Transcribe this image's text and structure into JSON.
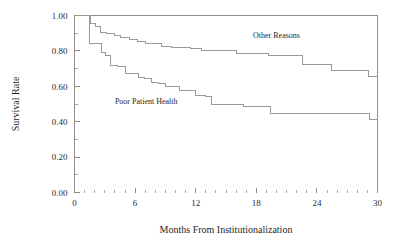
{
  "chart_data": {
    "type": "line",
    "subtype": "kaplan-meier-step",
    "title": "",
    "xlabel": "Months From Institutionalization",
    "ylabel": "Survival Rate",
    "xlim": [
      0,
      30
    ],
    "ylim": [
      0.0,
      1.0
    ],
    "grid": false,
    "legend_position": "inline-annotation",
    "xticks": [
      0,
      6,
      12,
      18,
      24,
      30
    ],
    "xtick_labels": [
      "0",
      "6",
      "12",
      "18",
      "24",
      "30"
    ],
    "x_minor_tick_interval": 1,
    "yticks": [
      0.0,
      0.2,
      0.4,
      0.6,
      0.8,
      1.0
    ],
    "ytick_labels": [
      "0.00",
      "0.20",
      "0.40",
      "0.60",
      "0.80",
      "1.00"
    ],
    "y_minor_tick_interval": 0.1,
    "series": [
      {
        "name": "Other Reasons",
        "label": "Other Reasons",
        "color": "#9a9a9a",
        "label_x": 20.0,
        "label_y": 0.875,
        "x": [
          0.0,
          1.0,
          1.6,
          2.1,
          2.6,
          3.2,
          4.0,
          4.6,
          5.4,
          6.2,
          7.0,
          7.8,
          8.6,
          9.6,
          10.6,
          11.5,
          12.6,
          13.1,
          16.0,
          18.9,
          19.2,
          22.0,
          22.6,
          24.9,
          25.4,
          28.7,
          29.1,
          30.0
        ],
        "y": [
          1.0,
          1.0,
          0.952,
          0.94,
          0.905,
          0.9,
          0.888,
          0.878,
          0.862,
          0.855,
          0.842,
          0.84,
          0.826,
          0.82,
          0.818,
          0.812,
          0.8,
          0.8,
          0.787,
          0.787,
          0.775,
          0.775,
          0.725,
          0.725,
          0.688,
          0.688,
          0.655,
          0.655
        ]
      },
      {
        "name": "Poor Patient Health",
        "label": "Poor Patient Health",
        "color": "#9a9a9a",
        "label_x": 7.1,
        "label_y": 0.5,
        "x": [
          0.0,
          0.9,
          1.5,
          2.2,
          2.7,
          3.1,
          3.6,
          4.3,
          5.0,
          5.6,
          6.3,
          6.9,
          7.6,
          8.3,
          9.0,
          9.7,
          10.4,
          11.2,
          12.0,
          13.0,
          13.6,
          16.1,
          16.7,
          18.9,
          19.4,
          28.6,
          29.2,
          30.0
        ],
        "y": [
          1.0,
          1.0,
          0.842,
          0.84,
          0.79,
          0.775,
          0.715,
          0.712,
          0.672,
          0.67,
          0.648,
          0.645,
          0.62,
          0.618,
          0.6,
          0.597,
          0.578,
          0.575,
          0.548,
          0.545,
          0.5,
          0.498,
          0.486,
          0.486,
          0.445,
          0.445,
          0.412,
          0.412
        ]
      }
    ]
  },
  "axes": {
    "y_title": "Survival Rate",
    "x_title": "Months From Institutionalization"
  }
}
